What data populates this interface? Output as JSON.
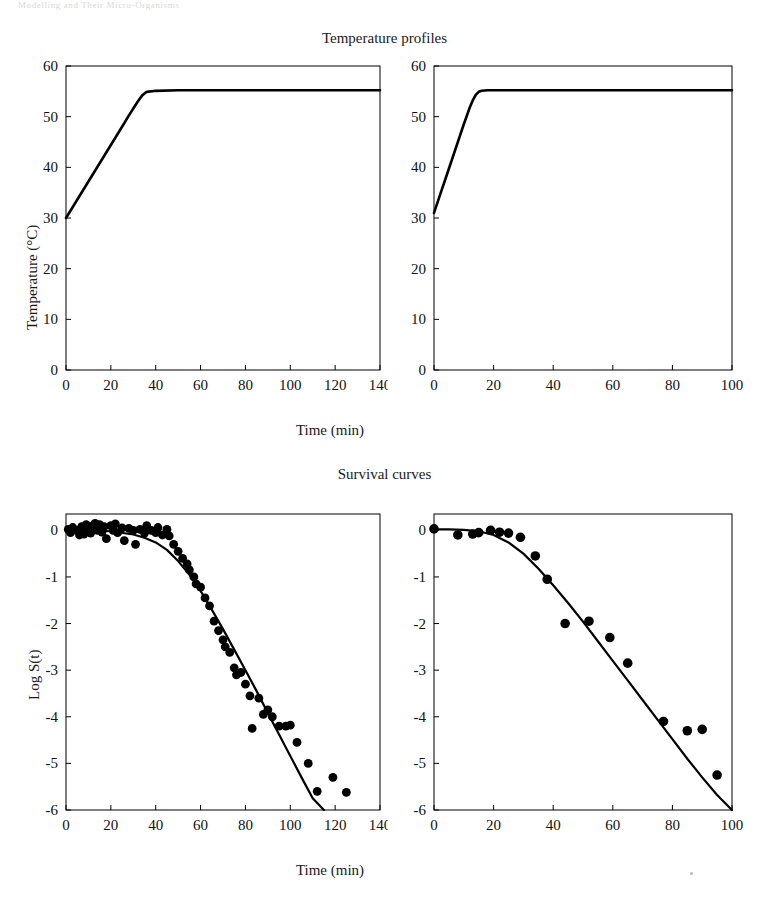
{
  "page": {
    "running_head": "Modelling and Their Micro-Organisms"
  },
  "figure": {
    "titles": {
      "temperature": "Temperature profiles",
      "survival": "Survival curves"
    },
    "axis_labels": {
      "time": "Time (min)",
      "temperature": "Temperature (°C)",
      "log_s": "Log S(t)"
    }
  },
  "chart_data": [
    {
      "id": "temperature-left",
      "type": "line",
      "title": "Temperature profiles",
      "panel": "left",
      "xlabel": "Time (min)",
      "ylabel": "Temperature (°C)",
      "xlim": [
        0,
        140
      ],
      "ylim": [
        0,
        60
      ],
      "xticks": [
        0,
        20,
        40,
        60,
        80,
        100,
        120,
        140
      ],
      "yticks": [
        0,
        10,
        20,
        30,
        40,
        50,
        60
      ],
      "grid": false,
      "legend": "none",
      "series": [
        {
          "name": "heating profile",
          "x": [
            0,
            5,
            10,
            15,
            20,
            25,
            28,
            30,
            32,
            34,
            36,
            40,
            50,
            60,
            70,
            80,
            90,
            100,
            110,
            120,
            130,
            140
          ],
          "y": [
            30.0,
            33.6,
            37.2,
            40.8,
            44.4,
            48.0,
            50.2,
            51.6,
            53.0,
            54.2,
            54.9,
            55.1,
            55.2,
            55.2,
            55.2,
            55.2,
            55.2,
            55.2,
            55.2,
            55.2,
            55.2,
            55.2
          ]
        }
      ]
    },
    {
      "id": "temperature-right",
      "type": "line",
      "title": "Temperature profiles",
      "panel": "right",
      "xlabel": "Time (min)",
      "ylabel": "Temperature (°C)",
      "xlim": [
        0,
        100
      ],
      "ylim": [
        0,
        60
      ],
      "xticks": [
        0,
        20,
        40,
        60,
        80,
        100
      ],
      "yticks": [
        0,
        10,
        20,
        30,
        40,
        50,
        60
      ],
      "grid": false,
      "legend": "none",
      "series": [
        {
          "name": "heating profile",
          "x": [
            0,
            2,
            4,
            6,
            8,
            10,
            12,
            13,
            14,
            15,
            16,
            18,
            20,
            30,
            40,
            50,
            60,
            70,
            80,
            90,
            100
          ],
          "y": [
            31.0,
            34.5,
            38.0,
            41.5,
            45.0,
            48.5,
            51.8,
            53.2,
            54.3,
            54.9,
            55.1,
            55.2,
            55.2,
            55.2,
            55.2,
            55.2,
            55.2,
            55.2,
            55.2,
            55.2,
            55.2
          ]
        }
      ]
    },
    {
      "id": "survival-left",
      "type": "scatter",
      "title": "Survival curves",
      "panel": "left",
      "xlabel": "Time (min)",
      "ylabel": "Log S(t)",
      "xlim": [
        0,
        140
      ],
      "ylim": [
        -6,
        0.35
      ],
      "xticks": [
        0,
        20,
        40,
        60,
        80,
        100,
        120,
        140
      ],
      "yticks": [
        0,
        -1,
        -2,
        -3,
        -4,
        -5,
        -6
      ],
      "grid": false,
      "legend": "none",
      "fit_curve": {
        "name": "fitted survival model",
        "x": [
          0,
          10,
          20,
          30,
          35,
          40,
          45,
          50,
          55,
          60,
          65,
          70,
          75,
          80,
          85,
          90,
          95,
          100,
          105,
          110,
          115
        ],
        "y": [
          0.02,
          0.0,
          -0.02,
          -0.09,
          -0.16,
          -0.26,
          -0.42,
          -0.66,
          -0.95,
          -1.3,
          -1.7,
          -2.12,
          -2.56,
          -3.0,
          -3.45,
          -3.92,
          -4.38,
          -4.84,
          -5.3,
          -5.75,
          -6.0
        ]
      },
      "points": [
        {
          "x": 1,
          "y": 0.02
        },
        {
          "x": 2,
          "y": -0.05
        },
        {
          "x": 3,
          "y": 0.06
        },
        {
          "x": 5,
          "y": 0.0
        },
        {
          "x": 6,
          "y": -0.1
        },
        {
          "x": 7,
          "y": 0.08
        },
        {
          "x": 8,
          "y": -0.08
        },
        {
          "x": 9,
          "y": 0.12
        },
        {
          "x": 10,
          "y": 0.04
        },
        {
          "x": 11,
          "y": -0.06
        },
        {
          "x": 12,
          "y": 0.1
        },
        {
          "x": 13,
          "y": 0.15
        },
        {
          "x": 14,
          "y": 0.0
        },
        {
          "x": 15,
          "y": 0.12
        },
        {
          "x": 16,
          "y": -0.04
        },
        {
          "x": 17,
          "y": 0.08
        },
        {
          "x": 18,
          "y": -0.18
        },
        {
          "x": 20,
          "y": 0.1
        },
        {
          "x": 21,
          "y": 0.0
        },
        {
          "x": 22,
          "y": 0.14
        },
        {
          "x": 23,
          "y": -0.05
        },
        {
          "x": 25,
          "y": 0.05
        },
        {
          "x": 26,
          "y": -0.22
        },
        {
          "x": 28,
          "y": 0.04
        },
        {
          "x": 30,
          "y": 0.0
        },
        {
          "x": 31,
          "y": -0.3
        },
        {
          "x": 33,
          "y": 0.02
        },
        {
          "x": 35,
          "y": -0.06
        },
        {
          "x": 36,
          "y": 0.1
        },
        {
          "x": 38,
          "y": 0.0
        },
        {
          "x": 40,
          "y": -0.05
        },
        {
          "x": 41,
          "y": 0.06
        },
        {
          "x": 43,
          "y": -0.1
        },
        {
          "x": 45,
          "y": 0.02
        },
        {
          "x": 46,
          "y": -0.12
        },
        {
          "x": 48,
          "y": -0.3
        },
        {
          "x": 50,
          "y": -0.45
        },
        {
          "x": 52,
          "y": -0.6
        },
        {
          "x": 54,
          "y": -0.72
        },
        {
          "x": 55,
          "y": -0.85
        },
        {
          "x": 57,
          "y": -1.0
        },
        {
          "x": 58,
          "y": -1.15
        },
        {
          "x": 60,
          "y": -1.22
        },
        {
          "x": 62,
          "y": -1.45
        },
        {
          "x": 64,
          "y": -1.62
        },
        {
          "x": 66,
          "y": -1.95
        },
        {
          "x": 68,
          "y": -2.15
        },
        {
          "x": 70,
          "y": -2.35
        },
        {
          "x": 71,
          "y": -2.5
        },
        {
          "x": 73,
          "y": -2.62
        },
        {
          "x": 75,
          "y": -2.95
        },
        {
          "x": 76,
          "y": -3.1
        },
        {
          "x": 78,
          "y": -3.05
        },
        {
          "x": 80,
          "y": -3.3
        },
        {
          "x": 82,
          "y": -3.55
        },
        {
          "x": 83,
          "y": -4.25
        },
        {
          "x": 86,
          "y": -3.6
        },
        {
          "x": 88,
          "y": -3.95
        },
        {
          "x": 90,
          "y": -3.85
        },
        {
          "x": 92,
          "y": -4.0
        },
        {
          "x": 95,
          "y": -4.2
        },
        {
          "x": 98,
          "y": -4.2
        },
        {
          "x": 100,
          "y": -4.18
        },
        {
          "x": 103,
          "y": -4.55
        },
        {
          "x": 108,
          "y": -5.0
        },
        {
          "x": 112,
          "y": -5.6
        },
        {
          "x": 119,
          "y": -5.3
        },
        {
          "x": 125,
          "y": -5.62
        }
      ]
    },
    {
      "id": "survival-right",
      "type": "scatter",
      "title": "Survival curves",
      "panel": "right",
      "xlabel": "Time (min)",
      "ylabel": "Log S(t)",
      "xlim": [
        0,
        100
      ],
      "ylim": [
        -6,
        0.35
      ],
      "xticks": [
        0,
        20,
        40,
        60,
        80,
        100
      ],
      "yticks": [
        0,
        -1,
        -2,
        -3,
        -4,
        -5,
        -6
      ],
      "grid": false,
      "legend": "none",
      "fit_curve": {
        "name": "fitted survival model",
        "x": [
          0,
          5,
          10,
          15,
          20,
          25,
          30,
          35,
          40,
          45,
          50,
          55,
          60,
          65,
          70,
          75,
          80,
          85,
          90,
          95,
          100
        ],
        "y": [
          0.02,
          0.02,
          0.01,
          -0.02,
          -0.1,
          -0.26,
          -0.5,
          -0.82,
          -1.18,
          -1.56,
          -1.96,
          -2.38,
          -2.8,
          -3.22,
          -3.64,
          -4.06,
          -4.48,
          -4.9,
          -5.3,
          -5.68,
          -6.0
        ]
      },
      "points": [
        {
          "x": 0,
          "y": 0.03
        },
        {
          "x": 8,
          "y": -0.1
        },
        {
          "x": 13,
          "y": -0.08
        },
        {
          "x": 15,
          "y": -0.05
        },
        {
          "x": 19,
          "y": 0.0
        },
        {
          "x": 22,
          "y": -0.04
        },
        {
          "x": 25,
          "y": -0.06
        },
        {
          "x": 29,
          "y": -0.15
        },
        {
          "x": 34,
          "y": -0.55
        },
        {
          "x": 38,
          "y": -1.05
        },
        {
          "x": 44,
          "y": -2.0
        },
        {
          "x": 52,
          "y": -1.95
        },
        {
          "x": 59,
          "y": -2.3
        },
        {
          "x": 65,
          "y": -2.85
        },
        {
          "x": 77,
          "y": -4.1
        },
        {
          "x": 85,
          "y": -4.3
        },
        {
          "x": 90,
          "y": -4.27
        },
        {
          "x": 95,
          "y": -5.25
        }
      ]
    }
  ]
}
